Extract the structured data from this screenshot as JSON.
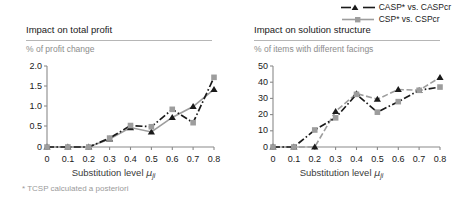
{
  "legend": {
    "items": [
      {
        "label": "CASP* vs. CASPcr",
        "color": "#1a1a1a",
        "marker": "triangle",
        "dash": "dashdot"
      },
      {
        "label": "CSP* vs. CSPcr",
        "color": "#9d9d9d",
        "marker": "square",
        "dash": "solid"
      }
    ]
  },
  "panels": [
    {
      "title": "Impact on total profit",
      "ylabel": "% of profit change",
      "xlabel_prefix": "Substitution level ",
      "xlabel_mu": "μ",
      "xlabel_sub": "ji",
      "footnote": "* TCSP calculated a posteriori",
      "ytick_labels": [
        "0",
        "0.5",
        "1.0",
        "1.5",
        "2.0"
      ],
      "xtick_labels": [
        "0",
        "0.1",
        "0.2",
        "0.3",
        "0.4",
        "0.5",
        "0.6",
        "0.7",
        "0.8"
      ]
    },
    {
      "title": "Impact on solution structure",
      "ylabel": "% of items with different facings",
      "xlabel_prefix": "Substitution level ",
      "xlabel_mu": "μ",
      "xlabel_sub": "ji",
      "footnote": "",
      "ytick_labels": [
        "0",
        "10",
        "20",
        "30",
        "40",
        "50"
      ],
      "xtick_labels": [
        "0",
        "0.1",
        "0.2",
        "0.3",
        "0.4",
        "0.5",
        "0.6",
        "0.7",
        "0.8"
      ]
    }
  ],
  "chart_data": [
    {
      "type": "line",
      "title": "Impact on total profit",
      "xlabel": "Substitution level μji",
      "ylabel": "% of profit change",
      "x": [
        0,
        0.1,
        0.2,
        0.3,
        0.4,
        0.5,
        0.6,
        0.7,
        0.8
      ],
      "xlim": [
        0,
        0.8
      ],
      "ylim": [
        0,
        2.0
      ],
      "yticks": [
        0,
        0.5,
        1.0,
        1.5,
        2.0
      ],
      "grid": false,
      "legend_position": "top-right-shared",
      "series": [
        {
          "name": "CASP* vs. CASPcr",
          "color": "#1a1a1a",
          "marker": "triangle",
          "values": [
            0,
            0,
            0,
            0.2,
            0.48,
            0.37,
            0.73,
            1.0,
            1.42
          ]
        },
        {
          "name": "CSP* vs. CSPcr",
          "color": "#9d9d9d",
          "marker": "square",
          "values": [
            0,
            0,
            0,
            0.22,
            0.53,
            0.5,
            0.93,
            0.6,
            1.72
          ]
        }
      ]
    },
    {
      "type": "line",
      "title": "Impact on solution structure",
      "xlabel": "Substitution level μji",
      "ylabel": "% of items with different facings",
      "x": [
        0,
        0.1,
        0.2,
        0.3,
        0.4,
        0.5,
        0.6,
        0.7,
        0.8
      ],
      "xlim": [
        0,
        0.8
      ],
      "ylim": [
        0,
        50
      ],
      "yticks": [
        0,
        10,
        20,
        30,
        40,
        50
      ],
      "grid": false,
      "legend_position": "top-right-shared",
      "series": [
        {
          "name": "CASP* vs. CASPcr",
          "color": "#1a1a1a",
          "marker": "triangle",
          "values": [
            0,
            0,
            0,
            22,
            33,
            29.5,
            35.5,
            35,
            43
          ]
        },
        {
          "name": "CSP* vs. CSPcr",
          "color": "#9d9d9d",
          "marker": "square",
          "values": [
            0,
            0,
            10.5,
            18,
            32.5,
            21.5,
            28,
            35,
            37
          ]
        }
      ]
    }
  ]
}
